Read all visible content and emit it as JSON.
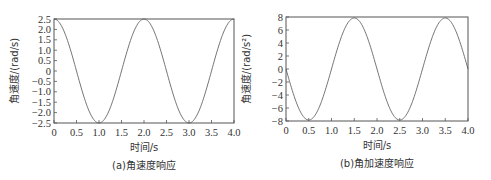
{
  "chart_data": [
    {
      "type": "line",
      "title": "",
      "caption": "(a)角速度响应",
      "xlabel": "时间/s",
      "ylabel": "角速度/(rad/s)",
      "xlim": [
        0,
        4.0
      ],
      "ylim": [
        -2.5,
        2.5
      ],
      "xticks": [
        "0",
        "0.5",
        "1.0",
        "1.5",
        "2.0",
        "2.5",
        "3.0",
        "3.5",
        "4.0"
      ],
      "yticks": [
        "2.5",
        "2.0",
        "1.5",
        "1.0",
        "0.5",
        "0",
        "-0.5",
        "-1.0",
        "-1.5",
        "-2.0",
        "-2.5"
      ],
      "grid": false,
      "series": [
        {
          "name": "angular-velocity",
          "function": "2.5*cos(pi*t)",
          "x": [
            0,
            0.25,
            0.5,
            0.75,
            1.0,
            1.25,
            1.5,
            1.75,
            2.0,
            2.25,
            2.5,
            2.75,
            3.0,
            3.25,
            3.5,
            3.75,
            4.0
          ],
          "y": [
            2.5,
            1.77,
            0,
            -1.77,
            -2.5,
            -1.77,
            0,
            1.77,
            2.5,
            1.77,
            0,
            -1.77,
            -2.5,
            -1.77,
            0,
            1.77,
            2.5
          ]
        }
      ]
    },
    {
      "type": "line",
      "title": "",
      "caption": "(b)角加速度响应",
      "xlabel": "时间/s",
      "ylabel": "角速度/(rad/s²)",
      "xlim": [
        0,
        4.0
      ],
      "ylim": [
        -8,
        8
      ],
      "xticks": [
        "0",
        "0.5",
        "1.0",
        "1.5",
        "2.0",
        "2.5",
        "3.0",
        "3.5",
        "4.0"
      ],
      "yticks": [
        "8",
        "6",
        "4",
        "2",
        "0",
        "-2",
        "-4",
        "-6",
        "-8"
      ],
      "grid": false,
      "series": [
        {
          "name": "angular-acceleration",
          "function": "-7.85*sin(pi*t)",
          "x": [
            0,
            0.25,
            0.5,
            0.75,
            1.0,
            1.25,
            1.5,
            1.75,
            2.0,
            2.25,
            2.5,
            2.75,
            3.0,
            3.25,
            3.5,
            3.75,
            4.0
          ],
          "y": [
            0,
            -5.55,
            -7.85,
            -5.55,
            0,
            5.55,
            7.85,
            5.55,
            0,
            -5.55,
            -7.85,
            -5.55,
            0,
            5.55,
            7.85,
            5.55,
            0
          ]
        }
      ]
    }
  ]
}
